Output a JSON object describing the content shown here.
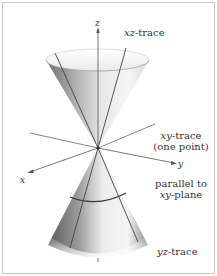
{
  "figure": {
    "axes": {
      "x_label": "x",
      "y_label": "y",
      "z_label": "z"
    },
    "labels": {
      "xz_trace_var": "xz",
      "xz_trace_suffix": "-trace",
      "xy_trace_var": "xy",
      "xy_trace_suffix": "-trace",
      "xy_trace_note": "(one point)",
      "parallel_line1": "parallel to",
      "parallel_var": "xy",
      "parallel_suffix": "-plane",
      "yz_trace_var": "yz",
      "yz_trace_suffix": "-trace"
    },
    "colors": {
      "border": "#c8c8c8",
      "axis": "#555555",
      "cone_dark": "#6e6e6e",
      "cone_light": "#f4f4f4",
      "text": "#333333"
    }
  }
}
